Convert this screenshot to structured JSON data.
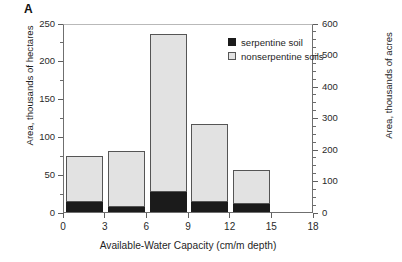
{
  "panel": {
    "label": "A"
  },
  "chart_data": {
    "type": "bar",
    "title": "",
    "subtitle": "",
    "stacked": true,
    "xlabel": "Available-Water Capacity (cm/m depth)",
    "ylabel": "Area, thousands of hectares",
    "ylabel_secondary": "Area, thousands of acres",
    "xlim": [
      0,
      18
    ],
    "ylim": [
      0,
      250
    ],
    "ylim_secondary": [
      0,
      600
    ],
    "xticks": [
      0,
      3,
      6,
      9,
      12,
      15,
      18
    ],
    "yticks": [
      0,
      50,
      100,
      150,
      200,
      250
    ],
    "yticks_secondary": [
      0,
      100,
      200,
      300,
      400,
      500,
      600
    ],
    "yminor_step": 25,
    "yminor_step_secondary": 25,
    "grid": false,
    "legend_position": "upper right",
    "categories": [
      "0-3",
      "3-6",
      "6-9",
      "9-12",
      "12-15"
    ],
    "bin_edges": [
      [
        0,
        3
      ],
      [
        3,
        6
      ],
      [
        6,
        9
      ],
      [
        9,
        12
      ],
      [
        12,
        15
      ]
    ],
    "series": [
      {
        "name": "serpentine soil",
        "color": "#1b1b1b",
        "values": [
          13,
          6,
          27,
          13,
          11
        ]
      },
      {
        "name": "nonserpentine soils",
        "color": "#e2e2e2",
        "values": [
          61,
          75,
          208,
          104,
          45
        ]
      }
    ],
    "totals": [
      74,
      81,
      235,
      117,
      56
    ]
  },
  "legend": {
    "items": [
      {
        "label": "serpentine soil",
        "swatch": "filled-square-icon"
      },
      {
        "label": "nonserpentine soils",
        "swatch": "outlined-square-icon"
      }
    ]
  },
  "colors": {
    "serpentine": "#1b1b1b",
    "nonserpentine": "#e2e2e2",
    "axis": "#5f5f5f",
    "text": "#1f1f1f",
    "background": "#ffffff"
  }
}
